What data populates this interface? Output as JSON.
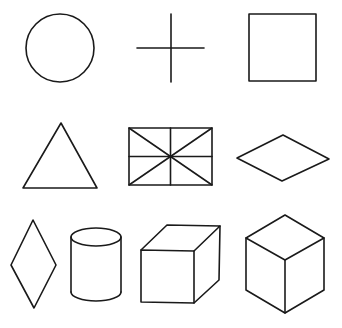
{
  "figure": {
    "stroke_color": "#1a1a1a",
    "background": "#ffffff",
    "shapes": [
      {
        "row": 1,
        "col": 1,
        "name": "circle"
      },
      {
        "row": 1,
        "col": 2,
        "name": "cross"
      },
      {
        "row": 1,
        "col": 3,
        "name": "square"
      },
      {
        "row": 2,
        "col": 1,
        "name": "triangle"
      },
      {
        "row": 2,
        "col": 2,
        "name": "rectangle-with-diagonals-and-midlines"
      },
      {
        "row": 2,
        "col": 3,
        "name": "horizontal-diamond"
      },
      {
        "row": 3,
        "col": 1,
        "name": "vertical-diamond"
      },
      {
        "row": 3,
        "col": 2,
        "name": "cylinder"
      },
      {
        "row": 3,
        "col": 3,
        "name": "oblique-cube"
      },
      {
        "row": 3,
        "col": 4,
        "name": "isometric-cube"
      }
    ]
  }
}
